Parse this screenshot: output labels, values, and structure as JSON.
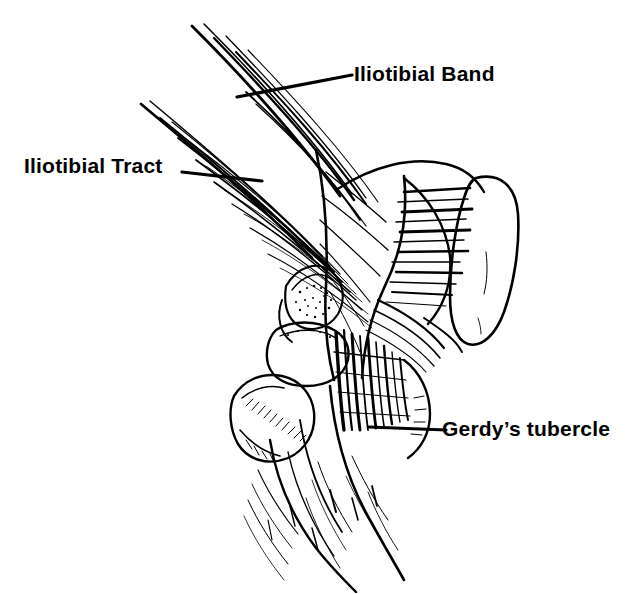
{
  "figure": {
    "view": "Lateral view of the right knee",
    "background_color": "#ffffff",
    "ink_color": "#000000",
    "width": 641,
    "height": 594
  },
  "labels": {
    "iliotibial_band": "Iliotibial Band",
    "iliotibial_tract": "Iliotibial Tract",
    "gerdys_tubercle": "Gerdy’s tubercle"
  },
  "leader_lines": {
    "iliotibial_band": {
      "x1": 237,
      "y1": 97,
      "x2": 352,
      "y2": 75
    },
    "iliotibial_tract": {
      "x1": 182,
      "y1": 172,
      "x2": 262,
      "y2": 181
    },
    "gerdys_tubercle": {
      "x1": 369,
      "y1": 427,
      "x2": 446,
      "y2": 430
    }
  },
  "structures": [
    {
      "name": "iliotibial-tract-fibers",
      "description": "Long parallel fibrous bands descending from upper left and upper center"
    },
    {
      "name": "femur-lateral-condyle",
      "description": "Distal femur with lateral condyle and horizontal hatch shading"
    },
    {
      "name": "patella",
      "description": "Oval patella at right margin with hatched medial border"
    },
    {
      "name": "joint-space",
      "description": "Stippled articular joint space between femoral condyle and tibial plateau"
    },
    {
      "name": "tibial-plateau",
      "description": "Proximal tibia articular platform"
    },
    {
      "name": "fibular-head",
      "description": "Head of fibula at lateral lower left of the knee"
    },
    {
      "name": "gerdys-tubercle-insertion",
      "description": "Dense converging tendon fibers inserting on the anterolateral tibia"
    },
    {
      "name": "tibia-shaft",
      "description": "Tibial shaft descending to lower right with diagonal shading strokes"
    }
  ]
}
